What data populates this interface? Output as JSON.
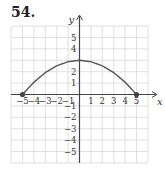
{
  "problem_number": "54.",
  "chart_data": {
    "type": "line",
    "title": "",
    "xlabel": "x",
    "ylabel": "y",
    "xlim": [
      -6,
      6
    ],
    "ylim": [
      -6,
      6
    ],
    "grid": true,
    "x_ticks": [
      "−5",
      "−4",
      "−3",
      "−2",
      "−1",
      "1",
      "2",
      "3",
      "4",
      "5"
    ],
    "y_ticks": [
      "5",
      "4",
      "2",
      "1",
      "−1",
      "−2",
      "−3",
      "−4",
      "−5"
    ],
    "series": [
      {
        "name": "curve",
        "x": [
          -5,
          -4,
          -3,
          -2,
          -1,
          0,
          1,
          2,
          3,
          4,
          5
        ],
        "y": [
          0,
          1.08,
          1.92,
          2.52,
          2.88,
          3,
          2.88,
          2.52,
          1.92,
          1.08,
          0
        ],
        "endpoints": [
          [
            -5,
            0
          ],
          [
            5,
            0
          ]
        ]
      }
    ],
    "colors": {
      "curve": "#555555",
      "grid": "#d8d8d8",
      "axis": "#444444"
    }
  }
}
